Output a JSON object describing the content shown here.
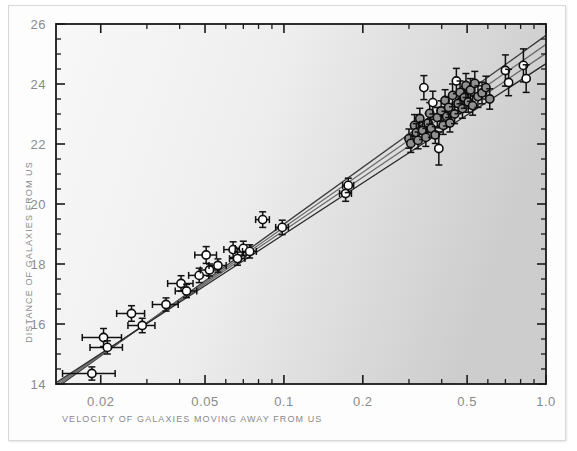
{
  "figure": {
    "background_color": "#fdfdfd",
    "plot_fill_left": "#f6f6f6",
    "plot_fill_right": "#cfcfcf",
    "axis_color": "#1a1a1a",
    "tick_label_color": "#8a8a8a"
  },
  "chart_data": {
    "type": "scatter",
    "title": "",
    "xlabel": "VELOCITY OF GALAXIES MOVING AWAY FROM US",
    "ylabel": "DISTANCE OF GALAXIES FROM US",
    "xscale": "log",
    "yscale": "linear",
    "xlim": [
      0.0135,
      1.0
    ],
    "ylim": [
      14,
      26
    ],
    "grid": false,
    "legend": "none",
    "xticks": [
      0.02,
      0.05,
      0.1,
      0.2,
      0.5,
      1.0
    ],
    "xtick_labels": [
      "0.02",
      "0.05",
      "0.1",
      "0.2",
      "0.5",
      "1.0"
    ],
    "yticks": [
      14,
      16,
      18,
      20,
      22,
      24,
      26
    ],
    "ytick_labels": [
      "14",
      "16",
      "18",
      "20",
      "22",
      "24",
      "26"
    ],
    "y_minor_step": 0.5,
    "marker": "open-circle",
    "marker_fill_primary": "#ffffff",
    "marker_fill_secondary": "#909090",
    "series": [
      {
        "name": "galaxies",
        "points": [
          {
            "x": 0.0185,
            "y": 14.35,
            "xerr": 0.0042,
            "yerr": 0.22,
            "fill": "#ffffff"
          },
          {
            "x": 0.0205,
            "y": 15.55,
            "xerr": 0.0035,
            "yerr": 0.3,
            "fill": "#ffffff"
          },
          {
            "x": 0.0212,
            "y": 15.22,
            "xerr": 0.003,
            "yerr": 0.22,
            "fill": "#ffffff"
          },
          {
            "x": 0.0262,
            "y": 16.35,
            "xerr": 0.0032,
            "yerr": 0.26,
            "fill": "#ffffff"
          },
          {
            "x": 0.0288,
            "y": 15.95,
            "xerr": 0.0034,
            "yerr": 0.24,
            "fill": "#ffffff"
          },
          {
            "x": 0.0355,
            "y": 16.65,
            "xerr": 0.004,
            "yerr": 0.22,
            "fill": "#ffffff"
          },
          {
            "x": 0.0405,
            "y": 17.35,
            "xerr": 0.0045,
            "yerr": 0.26,
            "fill": "#ffffff"
          },
          {
            "x": 0.0425,
            "y": 17.1,
            "xerr": 0.004,
            "yerr": 0.22,
            "fill": "#ffffff"
          },
          {
            "x": 0.0475,
            "y": 17.62,
            "xerr": 0.0042,
            "yerr": 0.24,
            "fill": "#ffffff"
          },
          {
            "x": 0.0505,
            "y": 18.3,
            "xerr": 0.0048,
            "yerr": 0.28,
            "fill": "#ffffff"
          },
          {
            "x": 0.052,
            "y": 17.8,
            "xerr": 0.004,
            "yerr": 0.2,
            "fill": "#ffffff"
          },
          {
            "x": 0.056,
            "y": 17.95,
            "xerr": 0.0042,
            "yerr": 0.22,
            "fill": "#ffffff"
          },
          {
            "x": 0.064,
            "y": 18.48,
            "xerr": 0.005,
            "yerr": 0.26,
            "fill": "#ffffff"
          },
          {
            "x": 0.0665,
            "y": 18.18,
            "xerr": 0.0045,
            "yerr": 0.22,
            "fill": "#ffffff"
          },
          {
            "x": 0.07,
            "y": 18.52,
            "xerr": 0.0048,
            "yerr": 0.24,
            "fill": "#ffffff"
          },
          {
            "x": 0.074,
            "y": 18.42,
            "xerr": 0.0045,
            "yerr": 0.22,
            "fill": "#ffffff"
          },
          {
            "x": 0.083,
            "y": 19.48,
            "xerr": 0.005,
            "yerr": 0.26,
            "fill": "#ffffff"
          },
          {
            "x": 0.0985,
            "y": 19.22,
            "xerr": 0.0055,
            "yerr": 0.24,
            "fill": "#ffffff"
          },
          {
            "x": 0.172,
            "y": 20.35,
            "xerr": 0.009,
            "yerr": 0.26,
            "fill": "#ffffff"
          },
          {
            "x": 0.176,
            "y": 20.62,
            "xerr": 0.0085,
            "yerr": 0.24,
            "fill": "#ffffff"
          },
          {
            "x": 0.3,
            "y": 22.18,
            "xerr": 0.0,
            "yerr": 0.32,
            "fill": "#909090"
          },
          {
            "x": 0.305,
            "y": 22.02,
            "xerr": 0.0,
            "yerr": 0.3,
            "fill": "#909090"
          },
          {
            "x": 0.315,
            "y": 22.62,
            "xerr": 0.0,
            "yerr": 0.36,
            "fill": "#909090"
          },
          {
            "x": 0.32,
            "y": 22.38,
            "xerr": 0.0,
            "yerr": 0.3,
            "fill": "#909090"
          },
          {
            "x": 0.325,
            "y": 22.12,
            "xerr": 0.0,
            "yerr": 0.28,
            "fill": "#909090"
          },
          {
            "x": 0.33,
            "y": 22.85,
            "xerr": 0.0,
            "yerr": 0.34,
            "fill": "#909090"
          },
          {
            "x": 0.338,
            "y": 22.45,
            "xerr": 0.0,
            "yerr": 0.3,
            "fill": "#909090"
          },
          {
            "x": 0.342,
            "y": 23.88,
            "xerr": 0.0,
            "yerr": 0.4,
            "fill": "#ffffff"
          },
          {
            "x": 0.348,
            "y": 22.22,
            "xerr": 0.0,
            "yerr": 0.3,
            "fill": "#909090"
          },
          {
            "x": 0.355,
            "y": 22.7,
            "xerr": 0.0,
            "yerr": 0.32,
            "fill": "#909090"
          },
          {
            "x": 0.36,
            "y": 23.02,
            "xerr": 0.0,
            "yerr": 0.36,
            "fill": "#909090"
          },
          {
            "x": 0.365,
            "y": 22.52,
            "xerr": 0.0,
            "yerr": 0.3,
            "fill": "#909090"
          },
          {
            "x": 0.37,
            "y": 23.38,
            "xerr": 0.0,
            "yerr": 0.38,
            "fill": "#ffffff"
          },
          {
            "x": 0.378,
            "y": 22.3,
            "xerr": 0.0,
            "yerr": 0.28,
            "fill": "#909090"
          },
          {
            "x": 0.385,
            "y": 22.88,
            "xerr": 0.0,
            "yerr": 0.34,
            "fill": "#909090"
          },
          {
            "x": 0.39,
            "y": 21.85,
            "xerr": 0.0,
            "yerr": 0.55,
            "fill": "#ffffff"
          },
          {
            "x": 0.398,
            "y": 23.1,
            "xerr": 0.0,
            "yerr": 0.34,
            "fill": "#909090"
          },
          {
            "x": 0.405,
            "y": 22.62,
            "xerr": 0.0,
            "yerr": 0.3,
            "fill": "#909090"
          },
          {
            "x": 0.412,
            "y": 23.45,
            "xerr": 0.0,
            "yerr": 0.36,
            "fill": "#909090"
          },
          {
            "x": 0.418,
            "y": 22.92,
            "xerr": 0.0,
            "yerr": 0.32,
            "fill": "#909090"
          },
          {
            "x": 0.425,
            "y": 23.22,
            "xerr": 0.0,
            "yerr": 0.34,
            "fill": "#909090"
          },
          {
            "x": 0.43,
            "y": 22.7,
            "xerr": 0.0,
            "yerr": 0.3,
            "fill": "#909090"
          },
          {
            "x": 0.44,
            "y": 23.62,
            "xerr": 0.0,
            "yerr": 0.38,
            "fill": "#909090"
          },
          {
            "x": 0.448,
            "y": 23.0,
            "xerr": 0.0,
            "yerr": 0.32,
            "fill": "#909090"
          },
          {
            "x": 0.455,
            "y": 24.1,
            "xerr": 0.0,
            "yerr": 0.42,
            "fill": "#ffffff"
          },
          {
            "x": 0.462,
            "y": 23.35,
            "xerr": 0.0,
            "yerr": 0.34,
            "fill": "#909090"
          },
          {
            "x": 0.47,
            "y": 23.72,
            "xerr": 0.0,
            "yerr": 0.38,
            "fill": "#909090"
          },
          {
            "x": 0.48,
            "y": 23.18,
            "xerr": 0.0,
            "yerr": 0.32,
            "fill": "#909090"
          },
          {
            "x": 0.488,
            "y": 23.55,
            "xerr": 0.0,
            "yerr": 0.36,
            "fill": "#909090"
          },
          {
            "x": 0.495,
            "y": 23.95,
            "xerr": 0.0,
            "yerr": 0.4,
            "fill": "#909090"
          },
          {
            "x": 0.505,
            "y": 23.4,
            "xerr": 0.0,
            "yerr": 0.34,
            "fill": "#909090"
          },
          {
            "x": 0.515,
            "y": 23.8,
            "xerr": 0.0,
            "yerr": 0.38,
            "fill": "#909090"
          },
          {
            "x": 0.525,
            "y": 23.28,
            "xerr": 0.0,
            "yerr": 0.32,
            "fill": "#909090"
          },
          {
            "x": 0.535,
            "y": 24.02,
            "xerr": 0.0,
            "yerr": 0.4,
            "fill": "#909090"
          },
          {
            "x": 0.55,
            "y": 23.58,
            "xerr": 0.0,
            "yerr": 0.36,
            "fill": "#909090"
          },
          {
            "x": 0.57,
            "y": 23.7,
            "xerr": 0.0,
            "yerr": 0.36,
            "fill": "#909090"
          },
          {
            "x": 0.59,
            "y": 23.88,
            "xerr": 0.0,
            "yerr": 0.38,
            "fill": "#909090"
          },
          {
            "x": 0.61,
            "y": 23.5,
            "xerr": 0.0,
            "yerr": 0.34,
            "fill": "#909090"
          },
          {
            "x": 0.7,
            "y": 24.45,
            "xerr": 0.0,
            "yerr": 0.52,
            "fill": "#ffffff"
          },
          {
            "x": 0.72,
            "y": 24.05,
            "xerr": 0.0,
            "yerr": 0.44,
            "fill": "#ffffff"
          },
          {
            "x": 0.82,
            "y": 24.62,
            "xerr": 0.0,
            "yerr": 0.55,
            "fill": "#ffffff"
          },
          {
            "x": 0.84,
            "y": 24.18,
            "xerr": 0.0,
            "yerr": 0.46,
            "fill": "#ffffff"
          }
        ]
      }
    ],
    "fit_lines": [
      {
        "name": "fit-upper",
        "x0": 0.0135,
        "y0": 13.86,
        "x1": 1.0,
        "y1": 25.62,
        "color": "#3a3a3a"
      },
      {
        "name": "fit-mid-upper",
        "x0": 0.0135,
        "y0": 13.92,
        "x1": 1.0,
        "y1": 25.32,
        "color": "#6a6a6a"
      },
      {
        "name": "fit-mid-lower",
        "x0": 0.0135,
        "y0": 13.98,
        "x1": 1.0,
        "y1": 25.02,
        "color": "#6a6a6a"
      },
      {
        "name": "fit-lower",
        "x0": 0.0135,
        "y0": 14.04,
        "x1": 1.0,
        "y1": 24.68,
        "color": "#2a2a2a"
      }
    ]
  }
}
